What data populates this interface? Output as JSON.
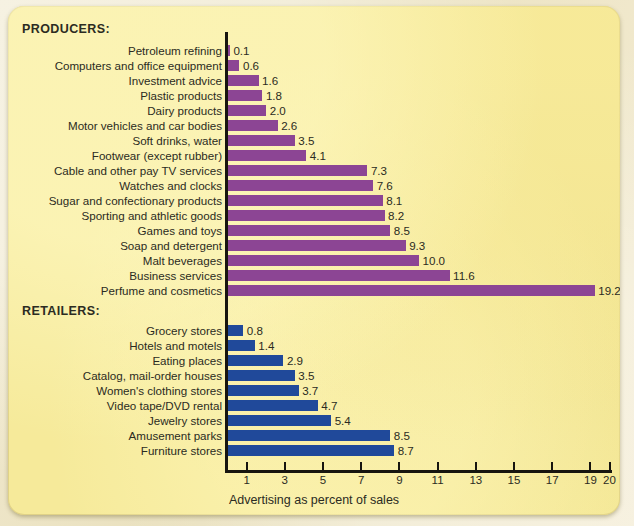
{
  "figure": {
    "producers_heading": "PRODUCERS:",
    "retailers_heading": "RETAILERS:",
    "axis_title": "Advertising as percent of sales"
  },
  "colors": {
    "producer_bar": "#8c4594",
    "retailer_bar": "#20499a",
    "card_background": "#f6ea9a",
    "axis": "#17150f",
    "text": "#2b2b22"
  },
  "chart_data": {
    "type": "bar",
    "orientation": "horizontal",
    "title": "",
    "xlabel": "Advertising as percent of sales",
    "ylabel": "",
    "xlim": [
      0,
      20
    ],
    "grid": false,
    "legend": "none",
    "xticks": [
      1,
      3,
      5,
      7,
      9,
      11,
      13,
      15,
      17,
      19,
      20
    ],
    "xtick_labels": [
      "1",
      "3",
      "5",
      "7",
      "9",
      "11",
      "13",
      "15",
      "17",
      "19",
      "20"
    ],
    "groups": [
      {
        "name": "PRODUCERS:",
        "color": "#8c4594",
        "categories": [
          "Petroleum refining",
          "Computers and office equipment",
          "Investment advice",
          "Plastic products",
          "Dairy products",
          "Motor vehicles and car bodies",
          "Soft drinks, water",
          "Footwear (except rubber)",
          "Cable and other pay TV services",
          "Watches and clocks",
          "Sugar and confectionary products",
          "Sporting and athletic goods",
          "Games and toys",
          "Soap and detergent",
          "Malt beverages",
          "Business services",
          "Perfume and cosmetics"
        ],
        "values": [
          0.1,
          0.6,
          1.6,
          1.8,
          2.0,
          2.6,
          3.5,
          4.1,
          7.3,
          7.6,
          8.1,
          8.2,
          8.5,
          9.3,
          10.0,
          11.6,
          19.2
        ],
        "value_labels": [
          "0.1",
          "0.6",
          "1.6",
          "1.8",
          "2.0",
          "2.6",
          "3.5",
          "4.1",
          "7.3",
          "7.6",
          "8.1",
          "8.2",
          "8.5",
          "9.3",
          "10.0",
          "11.6",
          "19.2"
        ]
      },
      {
        "name": "RETAILERS:",
        "color": "#20499a",
        "categories": [
          "Grocery stores",
          "Hotels and motels",
          "Eating places",
          "Catalog, mail-order houses",
          "Women's clothing stores",
          "Video tape/DVD rental",
          "Jewelry stores",
          "Amusement parks",
          "Furniture stores"
        ],
        "values": [
          0.8,
          1.4,
          2.9,
          3.5,
          3.7,
          4.7,
          5.4,
          8.5,
          8.7
        ],
        "value_labels": [
          "0.8",
          "1.4",
          "2.9",
          "3.5",
          "3.7",
          "4.7",
          "5.4",
          "8.5",
          "8.7"
        ]
      }
    ]
  }
}
